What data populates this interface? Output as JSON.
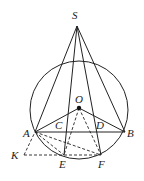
{
  "diagram": {
    "type": "geometry",
    "points": {
      "S": {
        "label": "S",
        "x": 77,
        "y": 26
      },
      "O": {
        "label": "O",
        "x": 79,
        "y": 108
      },
      "A": {
        "label": "A",
        "x": 35,
        "y": 132
      },
      "B": {
        "label": "B",
        "x": 125,
        "y": 132
      },
      "C": {
        "label": "C",
        "x": 60,
        "y": 132
      },
      "D": {
        "label": "D",
        "x": 99,
        "y": 132
      },
      "E": {
        "label": "E",
        "x": 64,
        "y": 155
      },
      "F": {
        "label": "F",
        "x": 101,
        "y": 155
      },
      "K": {
        "label": "K",
        "x": 24,
        "y": 155
      }
    },
    "circle": {
      "cx": 79,
      "cy": 110,
      "r": 49
    },
    "solid_segments": [
      "SA",
      "SE",
      "SF",
      "SB",
      "AB",
      "OA",
      "OB"
    ],
    "dashed_segments": [
      "OE",
      "OF",
      "AE",
      "AF",
      "KA",
      "KF"
    ]
  }
}
